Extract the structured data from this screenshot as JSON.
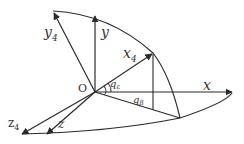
{
  "diagram": {
    "title": "",
    "colors": {
      "line": "#2a2a2a",
      "text": "#333333",
      "background": "#ffffff"
    },
    "origin": {
      "label": "O"
    },
    "axes": [
      {
        "id": "y4",
        "label": "y",
        "subscript": "4"
      },
      {
        "id": "y",
        "label": "y",
        "subscript": ""
      },
      {
        "id": "x4",
        "label": "x",
        "subscript": "4"
      },
      {
        "id": "x",
        "label": "x",
        "subscript": ""
      },
      {
        "id": "z4",
        "label": "z",
        "subscript": "4"
      },
      {
        "id": "z",
        "label": "z",
        "subscript": ""
      }
    ],
    "angles": [
      {
        "id": "q_epsilon",
        "label": "q",
        "subscript": "ε"
      },
      {
        "id": "q_beta",
        "label": "q",
        "subscript": "β"
      }
    ]
  }
}
